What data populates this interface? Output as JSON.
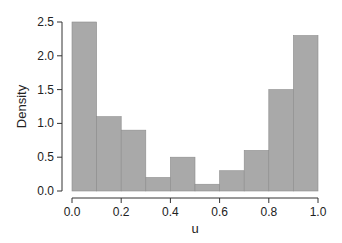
{
  "chart_data": {
    "type": "bar",
    "subtype": "histogram",
    "title": "",
    "xlabel": "u",
    "ylabel": "Density",
    "bin_edges": [
      0.0,
      0.1,
      0.2,
      0.3,
      0.4,
      0.5,
      0.6,
      0.7,
      0.8,
      0.9,
      1.0
    ],
    "values": [
      2.5,
      1.1,
      0.9,
      0.2,
      0.5,
      0.1,
      0.3,
      0.6,
      1.5,
      2.3
    ],
    "xlim": [
      0.0,
      1.0
    ],
    "ylim": [
      0.0,
      2.5
    ],
    "xticks": [
      0.0,
      0.2,
      0.4,
      0.6,
      0.8,
      1.0
    ],
    "xtick_labels": [
      "0.0",
      "0.2",
      "0.4",
      "0.6",
      "0.8",
      "1.0"
    ],
    "yticks": [
      0.0,
      0.5,
      1.0,
      1.5,
      2.0,
      2.5
    ],
    "ytick_labels": [
      "0.0",
      "0.5",
      "1.0",
      "1.5",
      "2.0",
      "2.5"
    ],
    "grid": false,
    "legend": null,
    "colors": {
      "bar_fill": "#a9a9a9",
      "bar_edge": "#8c8c8c",
      "axis": "#333333"
    }
  }
}
